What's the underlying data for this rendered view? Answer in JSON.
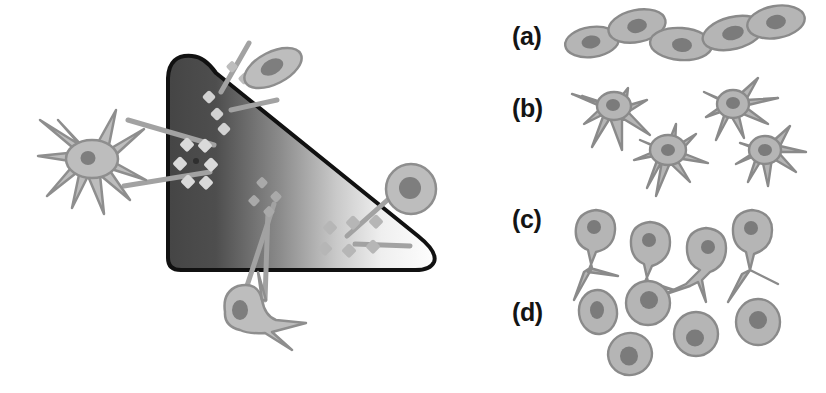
{
  "figure": {
    "background_color": "#ffffff"
  },
  "left_diagram": {
    "name": "gradient-wedge-diagram",
    "wedge": {
      "outline_color": "#111111",
      "outline_width": 4,
      "gradient_start_color": "#4a4a4a",
      "gradient_mid_color": "#9a9a9a",
      "gradient_end_color": "#fdfdfd",
      "description": "Wedge shaped region shaded dark gray on the left fading to white on the right"
    },
    "particle_clusters": [
      {
        "name": "cluster-upper-dark",
        "label": "clustered receptor particles on stiff region",
        "arrangement": "tight-vertical-chain",
        "particle_color": "#d2d2d2"
      },
      {
        "name": "cluster-left-ring",
        "label": "radial ring of receptor particles",
        "arrangement": "radial-ring",
        "particle_color": "#d8d8d8"
      },
      {
        "name": "cluster-center-sparse",
        "label": "sparse receptor particles in mid gradient",
        "arrangement": "loose-diagonal",
        "particle_color": "#a6a6a6"
      },
      {
        "name": "cluster-right-dispersed",
        "label": "dispersed receptor particles on compliant region",
        "arrangement": "dispersed-ring",
        "particle_color": "#b4b4b4"
      }
    ],
    "cells": [
      {
        "name": "cell-stellate-left",
        "morphology": "stellate",
        "body_color": "#b9b9b9",
        "nucleus_color": "#7e7e7e",
        "outline_color": "#8e8e8e"
      },
      {
        "name": "cell-spindle-top",
        "morphology": "spindle",
        "body_color": "#b9b9b9",
        "nucleus_color": "#7e7e7e",
        "outline_color": "#8e8e8e"
      },
      {
        "name": "cell-round-right",
        "morphology": "round",
        "body_color": "#b9b9b9",
        "nucleus_color": "#7e7e7e",
        "outline_color": "#8e8e8e"
      },
      {
        "name": "cell-bipolar-bottom",
        "morphology": "bipolar",
        "body_color": "#b9b9b9",
        "nucleus_color": "#7e7e7e",
        "outline_color": "#8e8e8e"
      }
    ],
    "connector_color": "#a0a0a0"
  },
  "right_panels": {
    "name": "morphology-panels",
    "items": [
      {
        "label": "(a)",
        "name": "panel-a",
        "morphology": "flattened-amoeboid",
        "cell_count": 5,
        "body_color": "#b5b5b5",
        "nucleus_color": "#7b7b7b",
        "outline_color": "#8a8a8a"
      },
      {
        "label": "(b)",
        "name": "panel-b",
        "morphology": "stellate-branched",
        "cell_count": 4,
        "body_color": "#b5b5b5",
        "nucleus_color": "#7b7b7b",
        "outline_color": "#8a8a8a"
      },
      {
        "label": "(c)",
        "name": "panel-c",
        "morphology": "bipolar-rod",
        "cell_count": 4,
        "body_color": "#b5b5b5",
        "nucleus_color": "#7b7b7b",
        "outline_color": "#8a8a8a"
      },
      {
        "label": "(d)",
        "name": "panel-d",
        "morphology": "rounded",
        "cell_count": 5,
        "body_color": "#b5b5b5",
        "nucleus_color": "#7b7b7b",
        "outline_color": "#8a8a8a"
      }
    ]
  }
}
